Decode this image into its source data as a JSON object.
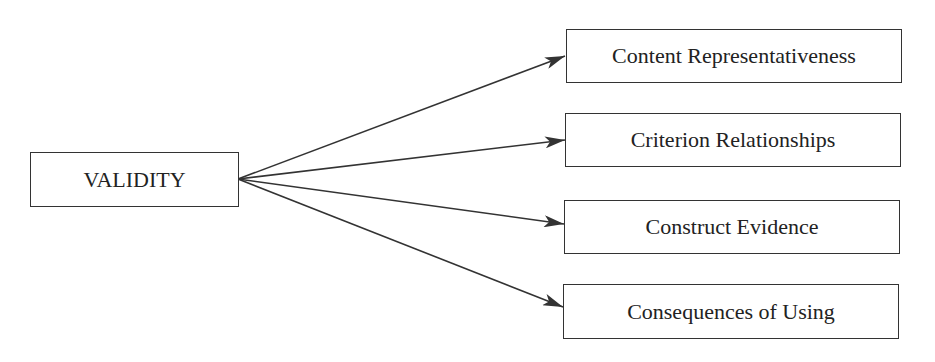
{
  "diagram": {
    "source": {
      "label": "VALIDITY"
    },
    "targets": [
      {
        "label": "Content Representativeness"
      },
      {
        "label": "Criterion Relationships"
      },
      {
        "label": "Construct Evidence"
      },
      {
        "label": "Consequences of Using"
      }
    ],
    "colors": {
      "line": "#333333",
      "text": "#222222",
      "background": "#ffffff"
    }
  }
}
